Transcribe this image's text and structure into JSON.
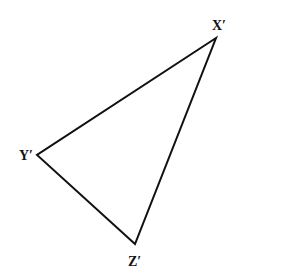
{
  "diagram": {
    "type": "triangle",
    "stroke_color": "#111111",
    "background": "#ffffff",
    "vertices": [
      {
        "label": "X′",
        "x": 216,
        "y": 38,
        "label_x": 212,
        "label_y": 30
      },
      {
        "label": "Y′",
        "x": 37,
        "y": 155,
        "label_x": 19,
        "label_y": 160
      },
      {
        "label": "Z′",
        "x": 135,
        "y": 244,
        "label_x": 128,
        "label_y": 266
      }
    ]
  }
}
